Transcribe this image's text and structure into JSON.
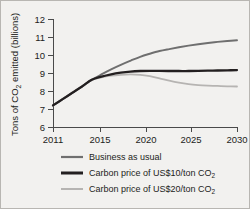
{
  "chart_data": {
    "type": "line",
    "title": "",
    "xlabel": "",
    "ylabel": "Tons of CO2 emitted (billions)",
    "ylabel_main": "Tons of CO",
    "ylabel_sub": "2",
    "ylabel_tail": " emitted (billions)",
    "xlim": [
      2011,
      2030
    ],
    "ylim": [
      6,
      12
    ],
    "grid": false,
    "legend_position": "below",
    "xticks": [
      2011,
      2015,
      2020,
      2025,
      2030
    ],
    "xtick_labels": [
      "2011",
      "2015",
      "2020",
      "2025",
      "2030"
    ],
    "yticks": [
      6,
      7,
      8,
      9,
      10,
      11,
      12
    ],
    "ytick_labels": [
      "6",
      "7",
      "8",
      "9",
      "10",
      "11",
      "12"
    ],
    "x": [
      2011,
      2012,
      2013,
      2014,
      2015,
      2016,
      2017,
      2018,
      2019,
      2020,
      2021,
      2022,
      2023,
      2024,
      2025,
      2026,
      2027,
      2028,
      2029,
      2030
    ],
    "series": [
      {
        "name": "Business as usual",
        "key": "business-as-usual",
        "color": "#6f6f6f",
        "width": 1.9,
        "values": [
          7.2,
          7.55,
          7.9,
          8.25,
          8.62,
          8.92,
          9.2,
          9.45,
          9.68,
          9.9,
          10.07,
          10.22,
          10.33,
          10.43,
          10.52,
          10.6,
          10.67,
          10.73,
          10.78,
          10.82
        ]
      },
      {
        "name": "Carbon price of US$10/ton CO2",
        "name_main": "Carbon price of US$10/ton CO",
        "name_sub": "2",
        "key": "carbon-price-10",
        "color": "#231f20",
        "width": 2.3,
        "values": [
          7.2,
          7.55,
          7.9,
          8.25,
          8.62,
          8.8,
          8.93,
          9.02,
          9.08,
          9.11,
          9.12,
          9.12,
          9.11,
          9.11,
          9.11,
          9.12,
          9.13,
          9.14,
          9.15,
          9.16
        ]
      },
      {
        "name": "Carbon price of US$20/ton CO2",
        "name_main": "Carbon price of US$20/ton CO",
        "name_sub": "2",
        "key": "carbon-price-20",
        "color": "#b6b4b2",
        "width": 1.8,
        "values": [
          7.2,
          7.55,
          7.9,
          8.25,
          8.62,
          8.76,
          8.85,
          8.9,
          8.92,
          8.9,
          8.82,
          8.7,
          8.57,
          8.46,
          8.38,
          8.33,
          8.3,
          8.28,
          8.26,
          8.25
        ]
      }
    ],
    "legend": [
      {
        "label": "Business as usual",
        "color": "#6f6f6f",
        "width": 2.2
      },
      {
        "label": "Carbon price of US$10/ton CO2",
        "color": "#231f20",
        "width": 3.0
      },
      {
        "label": "Carbon price of US$20/ton CO2",
        "color": "#b6b4b2",
        "width": 2.0
      }
    ],
    "colors": {
      "axis": "#4a4a4a",
      "text": "#1d1d1b",
      "background": "#f2f1ef",
      "border": "#b8b6b2"
    }
  }
}
